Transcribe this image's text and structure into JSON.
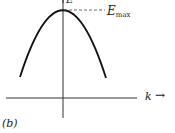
{
  "diagram": {
    "panel_label": "(b)",
    "y_axis_label": "E",
    "x_axis_label": "k",
    "x_axis_arrow": "→",
    "peak_label_main": "E",
    "peak_label_sub": "max",
    "curve": "downward parabola E(k) with maximum at k=0",
    "colors": {
      "curve": "#111111",
      "axes": "#333333",
      "dashed": "#444444"
    }
  }
}
